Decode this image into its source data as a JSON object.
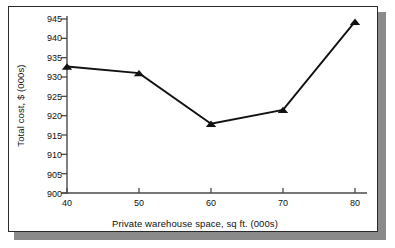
{
  "chart_data": {
    "type": "line",
    "title": "",
    "xlabel": "Private warehouse space, sq ft. (000s)",
    "ylabel": "Total cost, $ (000s)",
    "x": [
      40,
      50,
      60,
      70,
      80
    ],
    "values": [
      932.7,
      931.0,
      917.9,
      921.5,
      944.3
    ],
    "xticks": [
      40,
      50,
      60,
      70,
      80
    ],
    "yticks": [
      900,
      905,
      910,
      915,
      920,
      925,
      930,
      935,
      940,
      945
    ],
    "xlim": [
      40,
      80
    ],
    "ylim": [
      900,
      945
    ],
    "grid": false,
    "legend": null,
    "marker": "triangle",
    "series_color": "#111111",
    "line_color": "#111111",
    "background": "#ffffff",
    "frame_color": "#2b2b2b",
    "shadow_color": "#8a8a8a"
  },
  "labels": {
    "x_axis_title": "Private warehouse space, sq ft. (000s)",
    "y_axis_title": "Total cost, $ (000s)",
    "x_tick_0": "40",
    "x_tick_1": "50",
    "x_tick_2": "60",
    "x_tick_3": "70",
    "x_tick_4": "80",
    "y_tick_0": "900",
    "y_tick_1": "905",
    "y_tick_2": "910",
    "y_tick_3": "915",
    "y_tick_4": "920",
    "y_tick_5": "925",
    "y_tick_6": "930",
    "y_tick_7": "935",
    "y_tick_8": "940",
    "y_tick_9": "945"
  }
}
